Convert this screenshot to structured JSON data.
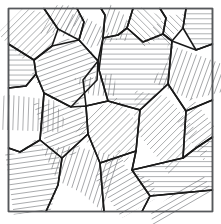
{
  "figure": {
    "width": 221,
    "height": 224,
    "background_color": "#ffffff",
    "frame": {
      "x": 8.5,
      "y": 8.5,
      "width": 204,
      "height": 203,
      "stroke_color": "#55585c",
      "stroke_width": 1.1
    },
    "style": {
      "cell_stroke_color": "#1a1a1a",
      "cell_stroke_width": 1.6,
      "hatch_stroke_color": "#6b6e72",
      "hatch_stroke_width": 0.55,
      "hatch_spacing": 5,
      "cell_count": 22
    }
  },
  "chart_data": {
    "type": "diagram",
    "title": "Hatched polygonal tessellation",
    "xlabel": "",
    "ylabel": "",
    "xlim": [
      8.5,
      212.5
    ],
    "ylim": [
      8.5,
      211.5
    ],
    "grid": false,
    "legend": false,
    "cells": [
      {
        "id": "cell-01",
        "name": "top-left-upper",
        "hatch_angle_deg": 45,
        "points": "8.5,8.5 44,8.5 58,29 52,46 34,60 8.5,44"
      },
      {
        "id": "cell-02",
        "name": "top-left-narrow-wedge",
        "hatch_angle_deg": 60,
        "points": "44,8.5 77,8.5 84,22 79,40 58,29"
      },
      {
        "id": "cell-03",
        "name": "top-center-left-tall",
        "hatch_angle_deg": 65,
        "points": "77,8.5 101,8.5 105,15 103,38 98,61 79,40 84,22"
      },
      {
        "id": "cell-04",
        "name": "top-center-block",
        "hatch_angle_deg": 70,
        "points": "101,8.5 133,8.5 127,28 118,35 103,38 105,15"
      },
      {
        "id": "cell-05",
        "name": "top-center-right",
        "hatch_angle_deg": 135,
        "points": "133,8.5 160,8.5 166,18 163,34 143,42 127,28"
      },
      {
        "id": "cell-06",
        "name": "top-right-wedge",
        "hatch_angle_deg": 135,
        "points": "160,8.5 186,8.5 183,28 172,41 163,34 166,18"
      },
      {
        "id": "cell-07",
        "name": "top-right-corner",
        "hatch_angle_deg": 0,
        "points": "186,8.5 212.5,8.5 212.5,44 196,50 183,28"
      },
      {
        "id": "cell-08",
        "name": "left-upper-mid",
        "hatch_angle_deg": 0,
        "points": "8.5,44 34,60 36,74 26,86 8.5,88"
      },
      {
        "id": "cell-09",
        "name": "left-mid-large",
        "hatch_angle_deg": 20,
        "points": "34,60 52,46 79,40 98,61 97,80 71,107 44,93 36,74"
      },
      {
        "id": "cell-10",
        "name": "center-large-horizontal",
        "hatch_angle_deg": 0,
        "points": "103,38 118,35 127,28 143,42 163,34 172,41 168,84 140,110 108,101 99,70"
      },
      {
        "id": "cell-11",
        "name": "center-small-vertical-strip",
        "hatch_angle_deg": 82,
        "points": "98,61 99,70 108,101 86,106 83,80"
      },
      {
        "id": "cell-12",
        "name": "right-upper-hatched",
        "hatch_angle_deg": 70,
        "points": "172,41 196,50 212.5,44 212.5,100 186,111 168,84"
      },
      {
        "id": "cell-13",
        "name": "left-lower-vertical",
        "hatch_angle_deg": 88,
        "points": "8.5,88 26,86 36,74 44,93 40,140 20,152 8.5,148"
      },
      {
        "id": "cell-14",
        "name": "center-left-diagonal",
        "hatch_angle_deg": 22,
        "points": "44,93 71,107 86,106 88,134 62,158 40,140"
      },
      {
        "id": "cell-15",
        "name": "center-diamond",
        "hatch_angle_deg": 45,
        "points": "86,106 108,101 140,110 136,151 100,163 88,134"
      },
      {
        "id": "cell-16",
        "name": "right-mid-large-diagonal",
        "hatch_angle_deg": 45,
        "points": "140,110 168,84 186,111 183,158 132,170 136,151"
      },
      {
        "id": "cell-17",
        "name": "right-edge-upper",
        "hatch_angle_deg": 38,
        "points": "186,111 212.5,100 212.5,137 196,148 183,158"
      },
      {
        "id": "cell-18",
        "name": "bottom-left-large",
        "hatch_angle_deg": 8,
        "points": "8.5,148 20,152 40,140 62,158 58,185 46,211.5 8.5,211.5"
      },
      {
        "id": "cell-19",
        "name": "bottom-center-left",
        "hatch_angle_deg": 72,
        "points": "62,158 88,134 100,163 104,211.5 46,211.5 58,185"
      },
      {
        "id": "cell-20",
        "name": "bottom-center-right",
        "hatch_angle_deg": 30,
        "points": "100,163 136,151 132,170 150,196 142,211.5 104,211.5"
      },
      {
        "id": "cell-21",
        "name": "bottom-right-horizontal",
        "hatch_angle_deg": 0,
        "points": "132,170 183,158 196,148 212.5,137 212.5,190 150,196"
      },
      {
        "id": "cell-22",
        "name": "bottom-right-corner",
        "hatch_angle_deg": 30,
        "points": "150,196 212.5,190 212.5,211.5 142,211.5"
      }
    ]
  }
}
